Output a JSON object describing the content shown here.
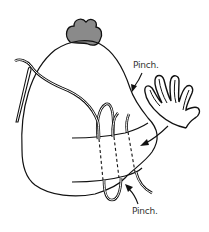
{
  "figure": {
    "labels": {
      "pinch_top": "Pinch.",
      "pinch_bottom": "Pinch."
    },
    "colors": {
      "line": "#111111",
      "comb_fill": "#8a8a8a",
      "background": "#ffffff",
      "label_text": "#333333"
    },
    "parts": [
      "comb",
      "body",
      "hand",
      "needle",
      "thread",
      "stitch-band",
      "arrows"
    ]
  }
}
